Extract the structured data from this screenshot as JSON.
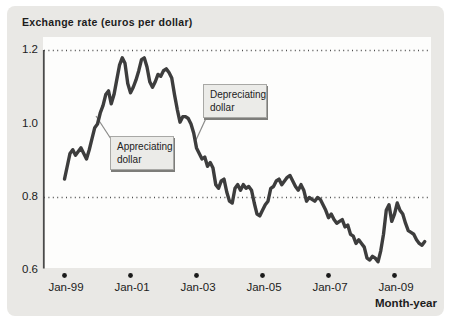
{
  "figure": {
    "title": "Exchange rate (euros per dollar)",
    "x_axis_label": "Month-year",
    "y_tick_labels": [
      "1.2",
      "1.0",
      "0.8",
      "0.6"
    ],
    "x_tick_labels": [
      "Jan-99",
      "Jan-01",
      "Jan-03",
      "Jan-05",
      "Jan-07",
      "Jan-09"
    ],
    "annotations": {
      "appreciating": "Appreciating dollar",
      "depreciating": "Depreciating dollar"
    },
    "colors": {
      "figure_background": "#e9e8e5",
      "plot_background": "#fdfdfc",
      "line": "#3d3d3d",
      "gridline": "#4f4f4f",
      "axis": "#4a4a4a",
      "tick_dot": "#1a1a1a",
      "annotation_fill": "#ebebe8",
      "annotation_border": "#a8a8a5"
    }
  },
  "chart_data": {
    "type": "line",
    "title": "Exchange rate (euros per dollar)",
    "xlabel": "Month-year",
    "ylabel": "Exchange rate (euros per dollar)",
    "ylim": [
      0.6,
      1.2
    ],
    "yticks": [
      1.2,
      1.0,
      0.8,
      0.6
    ],
    "dotted_gridlines_at": [
      1.2,
      0.8
    ],
    "xticks": [
      "Jan-99",
      "Jan-01",
      "Jan-03",
      "Jan-05",
      "Jan-07",
      "Jan-09"
    ],
    "x_frequency": "monthly",
    "x_start": "Jan-1999",
    "x_end": "Dec-2009",
    "legend": "none",
    "grid": "dotted horizontal at 1.2 and 0.8 only",
    "annotations": [
      {
        "text": "Appreciating dollar",
        "points_to": "rising segment during 1999-2000"
      },
      {
        "text": "Depreciating dollar",
        "points_to": "falling segment during 2002-2003"
      }
    ],
    "series": [
      {
        "name": "Euros per dollar",
        "values": [
          0.85,
          0.885,
          0.92,
          0.93,
          0.915,
          0.925,
          0.935,
          0.92,
          0.905,
          0.93,
          0.96,
          0.99,
          1.0,
          1.03,
          1.05,
          1.08,
          1.09,
          1.055,
          1.08,
          1.12,
          1.16,
          1.18,
          1.165,
          1.11,
          1.085,
          1.1,
          1.12,
          1.145,
          1.175,
          1.18,
          1.155,
          1.115,
          1.1,
          1.115,
          1.135,
          1.13,
          1.145,
          1.15,
          1.14,
          1.125,
          1.08,
          1.04,
          1.005,
          1.02,
          1.02,
          1.015,
          1.0,
          0.975,
          0.935,
          0.92,
          0.905,
          0.91,
          0.885,
          0.895,
          0.88,
          0.835,
          0.825,
          0.845,
          0.85,
          0.815,
          0.79,
          0.785,
          0.825,
          0.835,
          0.82,
          0.835,
          0.825,
          0.83,
          0.82,
          0.785,
          0.755,
          0.75,
          0.765,
          0.78,
          0.79,
          0.825,
          0.83,
          0.845,
          0.85,
          0.835,
          0.845,
          0.855,
          0.86,
          0.845,
          0.83,
          0.82,
          0.835,
          0.82,
          0.79,
          0.8,
          0.795,
          0.79,
          0.8,
          0.795,
          0.78,
          0.765,
          0.745,
          0.755,
          0.74,
          0.73,
          0.735,
          0.74,
          0.72,
          0.725,
          0.7,
          0.695,
          0.675,
          0.685,
          0.675,
          0.665,
          0.635,
          0.63,
          0.64,
          0.635,
          0.625,
          0.655,
          0.7,
          0.765,
          0.78,
          0.735,
          0.755,
          0.785,
          0.765,
          0.755,
          0.73,
          0.71,
          0.705,
          0.7,
          0.685,
          0.675,
          0.67,
          0.68
        ]
      }
    ]
  }
}
